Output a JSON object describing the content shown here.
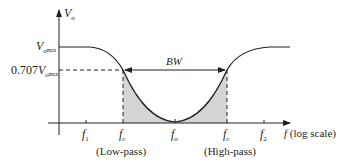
{
  "diagram": {
    "type": "band-stop filter frequency response",
    "y_axis": {
      "label_main": "V",
      "label_sub": "o"
    },
    "x_axis": {
      "label_main": "f",
      "label_suffix": "(log scale)"
    },
    "y_levels": {
      "max": {
        "main": "V",
        "sub": "o",
        "subsub": "max"
      },
      "cutoff": {
        "prefix": "0.707",
        "main": "V",
        "sub": "o",
        "subsub": "max"
      }
    },
    "x_ticks": [
      {
        "main": "f",
        "sub": "1"
      },
      {
        "main": "f",
        "sub": "c"
      },
      {
        "main": "f",
        "sub": "o"
      },
      {
        "main": "f",
        "sub": "c"
      },
      {
        "main": "f",
        "sub": "2"
      }
    ],
    "region_labels": {
      "low": "(Low-pass)",
      "high": "(High-pass)"
    },
    "bandwidth_label": "BW",
    "colors": {
      "line": "#231f20",
      "shade": "#d4d4d4"
    }
  }
}
